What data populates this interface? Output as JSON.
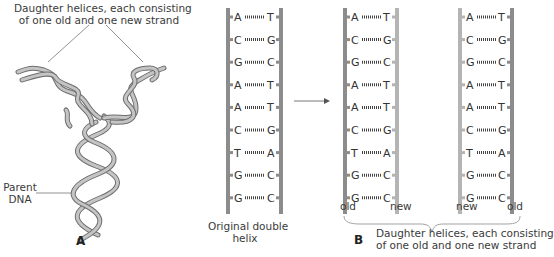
{
  "panel_a": {
    "letter": "A",
    "top_caption_line1": "Daughter helices, each consisting",
    "top_caption_line2": "of one old and one new strand",
    "parent_label_line1": "Parent",
    "parent_label_line2": "DNA"
  },
  "panel_b": {
    "letter": "B",
    "original_label_line1": "Original double",
    "original_label_line2": "helix",
    "daughter1_left_label": "old",
    "daughter1_right_label": "new",
    "daughter2_left_label": "new",
    "daughter2_right_label": "old",
    "bottom_caption_line1": "Daughter helices, each consisting",
    "bottom_caption_line2": "of one old and one new strand",
    "base_pairs": [
      [
        "A",
        "T"
      ],
      [
        "C",
        "G"
      ],
      [
        "G",
        "C"
      ],
      [
        "A",
        "T"
      ],
      [
        "A",
        "T"
      ],
      [
        "C",
        "G"
      ],
      [
        "T",
        "A"
      ],
      [
        "G",
        "C"
      ],
      [
        "G",
        "C"
      ]
    ]
  },
  "colors": {
    "old_strand": "#8c8c8c",
    "new_strand": "#b4b4b4",
    "text": "#3a3a3a",
    "helix_stroke": "#6e6e6e",
    "helix_fill": "#bdbdbd"
  }
}
